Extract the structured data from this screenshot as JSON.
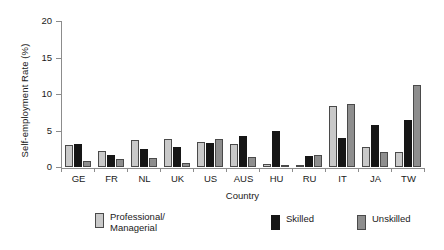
{
  "chart_data": {
    "type": "bar",
    "title": "",
    "xlabel": "Country",
    "ylabel": "Self-employment Rate (%)",
    "ylim": [
      0,
      20
    ],
    "yticks": [
      0,
      5,
      10,
      15,
      20
    ],
    "ytick_labels": [
      "0",
      "5",
      "10",
      "15",
      "20"
    ],
    "grid": false,
    "legend_position": "bottom",
    "categories": [
      "GE",
      "FR",
      "NL",
      "UK",
      "US",
      "AUS",
      "HU",
      "RU",
      "IT",
      "JA",
      "TW"
    ],
    "series": [
      {
        "name": "Professional/\nManagerial",
        "legend_label": "Professional/\nManagerial",
        "color": "#c9c9c9",
        "values": [
          3.0,
          2.2,
          3.7,
          3.9,
          3.4,
          3.1,
          0.4,
          0.3,
          8.4,
          2.7,
          2.1
        ]
      },
      {
        "name": "Skilled",
        "legend_label": "Skilled",
        "color": "#161616",
        "values": [
          3.1,
          1.7,
          2.4,
          2.7,
          3.3,
          4.2,
          5.0,
          1.5,
          4.0,
          5.8,
          6.4
        ]
      },
      {
        "name": "Unskilled",
        "legend_label": "Unskilled",
        "color": "#8e8e8e",
        "values": [
          0.8,
          1.1,
          1.2,
          0.5,
          3.9,
          1.4,
          0.3,
          1.7,
          8.7,
          2.1,
          11.2
        ]
      }
    ]
  }
}
